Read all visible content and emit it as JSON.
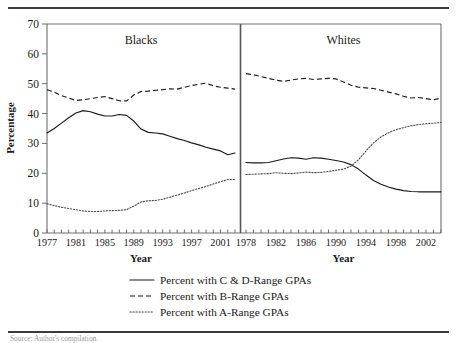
{
  "figure": {
    "source_note": "Source: Author's compilation."
  },
  "axes": {
    "ylabel": "Percentage",
    "xlabel": "Year",
    "yticks": [
      0,
      10,
      20,
      30,
      40,
      50,
      60,
      70
    ],
    "ylim": [
      0,
      70
    ]
  },
  "legend": {
    "items": [
      {
        "style": "solid",
        "label": "Percent with C & D-Range GPAs"
      },
      {
        "style": "dashed",
        "label": "Percent with B-Range GPAs"
      },
      {
        "style": "dotted",
        "label": "Percent with A-Range GPAs"
      }
    ]
  },
  "chart_data": {
    "type": "line",
    "title": "",
    "ylabel": "Percentage",
    "xlabel": "Year",
    "ylim": [
      0,
      70
    ],
    "grid": false,
    "legend_position": "bottom",
    "panels": [
      {
        "name": "Blacks",
        "title": "Blacks",
        "xlabel": "Year",
        "xlim": [
          1977,
          2003
        ],
        "xticks": [
          1977,
          1981,
          1985,
          1989,
          1993,
          1997,
          2001
        ],
        "x": [
          1977,
          1978,
          1979,
          1980,
          1981,
          1982,
          1983,
          1984,
          1985,
          1986,
          1987,
          1988,
          1989,
          1990,
          1991,
          1992,
          1993,
          1994,
          1995,
          1996,
          1997,
          1998,
          1999,
          2000,
          2001,
          2002,
          2003
        ],
        "series": [
          {
            "name": "Percent with C & D-Range GPAs",
            "style": "solid",
            "values": [
              33.5,
              35.0,
              36.8,
              38.6,
              40.2,
              41.0,
              40.6,
              39.8,
              39.2,
              39.2,
              39.7,
              39.4,
              37.5,
              34.8,
              33.7,
              33.5,
              33.2,
              32.4,
              31.6,
              31.0,
              30.2,
              29.5,
              28.7,
              28.1,
              27.5,
              26.2,
              26.8
            ]
          },
          {
            "name": "Percent with B-Range GPAs",
            "style": "dashed",
            "values": [
              48.0,
              47.2,
              46.0,
              45.2,
              44.4,
              44.6,
              45.0,
              45.4,
              45.7,
              45.0,
              44.3,
              44.2,
              46.2,
              47.4,
              47.5,
              47.8,
              48.0,
              48.3,
              48.2,
              48.8,
              49.4,
              49.8,
              50.2,
              49.3,
              48.8,
              48.5,
              48.2
            ]
          },
          {
            "name": "Percent with A-Range GPAs",
            "style": "dotted",
            "values": [
              9.8,
              9.2,
              8.6,
              8.2,
              7.8,
              7.4,
              7.2,
              7.2,
              7.4,
              7.5,
              7.6,
              7.8,
              9.0,
              10.4,
              10.8,
              10.9,
              11.3,
              12.0,
              12.7,
              13.4,
              14.2,
              14.9,
              15.6,
              16.4,
              17.2,
              17.9,
              17.9
            ]
          }
        ]
      },
      {
        "name": "Whites",
        "title": "Whites",
        "xlabel": "Year",
        "xlim": [
          1978,
          2004
        ],
        "xticks": [
          1978,
          1982,
          1986,
          1990,
          1994,
          1998,
          2002
        ],
        "x": [
          1978,
          1979,
          1980,
          1981,
          1982,
          1983,
          1984,
          1985,
          1986,
          1987,
          1988,
          1989,
          1990,
          1991,
          1992,
          1993,
          1994,
          1995,
          1996,
          1997,
          1998,
          1999,
          2000,
          2001,
          2002,
          2003,
          2004
        ],
        "series": [
          {
            "name": "Percent with C & D-Range GPAs",
            "style": "solid",
            "values": [
              23.6,
              23.5,
              23.5,
              23.6,
              24.2,
              24.8,
              25.2,
              25.1,
              24.7,
              25.2,
              25.1,
              24.7,
              24.3,
              23.8,
              22.9,
              21.4,
              19.4,
              17.6,
              16.3,
              15.4,
              14.7,
              14.2,
              13.9,
              13.8,
              13.8,
              13.8,
              13.8
            ]
          },
          {
            "name": "Percent with B-Range GPAs",
            "style": "dashed",
            "values": [
              53.4,
              53.0,
              52.4,
              51.8,
              51.2,
              50.8,
              51.2,
              51.6,
              51.8,
              51.4,
              51.6,
              51.8,
              51.6,
              50.6,
              49.5,
              48.8,
              48.6,
              48.4,
              47.8,
              47.2,
              46.6,
              45.8,
              45.2,
              45.4,
              45.0,
              44.6,
              45.2
            ]
          },
          {
            "name": "Percent with A-Range GPAs",
            "style": "dotted",
            "values": [
              19.6,
              19.7,
              19.8,
              19.9,
              20.2,
              20.0,
              19.9,
              20.1,
              20.4,
              20.2,
              20.3,
              20.6,
              21.0,
              21.4,
              22.4,
              24.5,
              27.5,
              30.2,
              32.2,
              33.6,
              34.6,
              35.3,
              35.9,
              36.3,
              36.6,
              36.8,
              37.0
            ]
          }
        ]
      }
    ]
  }
}
